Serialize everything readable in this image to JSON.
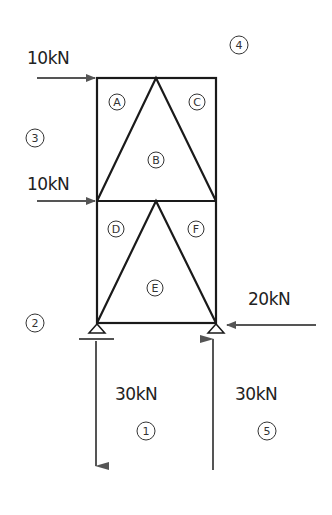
{
  "forces": [
    {
      "id": "load-top-left",
      "label": "10kN",
      "direction": "right"
    },
    {
      "id": "load-mid-left",
      "label": "10kN",
      "direction": "right"
    },
    {
      "id": "load-bottom-right",
      "label": "20kN",
      "direction": "left"
    },
    {
      "id": "reaction-left",
      "label": "30kN",
      "direction": "down"
    },
    {
      "id": "reaction-right",
      "label": "30kN",
      "direction": "up"
    }
  ],
  "spaces_internal": [
    "A",
    "B",
    "C",
    "D",
    "E",
    "F"
  ],
  "spaces_external": [
    "1",
    "2",
    "3",
    "4",
    "5"
  ],
  "colors": {
    "member": "#1a1a1a",
    "arrow": "#555555",
    "text": "#222222"
  }
}
